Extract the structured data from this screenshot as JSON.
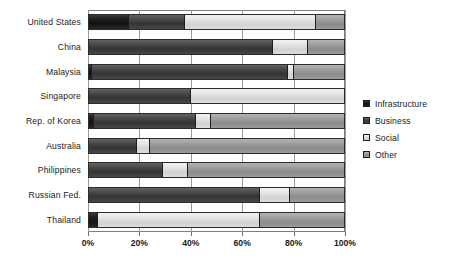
{
  "chart_data": {
    "type": "bar",
    "orientation": "horizontal",
    "stacked": true,
    "normalized": true,
    "title": "",
    "subtitle": "",
    "xlabel": "",
    "ylabel": "",
    "xlim": [
      0,
      100
    ],
    "xticks": [
      0,
      20,
      40,
      60,
      80,
      100
    ],
    "xticklabels": [
      "0%",
      "20%",
      "40%",
      "60%",
      "80%",
      "100%"
    ],
    "grid": true,
    "grid_axis": "x",
    "legend_position": "right",
    "categories": [
      "United States",
      "China",
      "Malaysia",
      "Singapore",
      "Rep. of Korea",
      "Australia",
      "Philippines",
      "Russian Fed.",
      "Thailand"
    ],
    "series": [
      {
        "name": "Infrastructure",
        "color": "#1c1c1c",
        "values": [
          15.5,
          0,
          1.2,
          0,
          2.0,
          0,
          0,
          0,
          3.5
        ]
      },
      {
        "name": "Business",
        "color": "#414141",
        "values": [
          22.2,
          72.0,
          76.8,
          40.0,
          40.0,
          19.0,
          29.0,
          67.0,
          0
        ]
      },
      {
        "name": "Social",
        "color": "#dedede",
        "values": [
          51.3,
          14.0,
          2.5,
          60.0,
          6.0,
          5.0,
          10.0,
          12.0,
          63.5
        ]
      },
      {
        "name": "Other",
        "color": "#9a9a9a",
        "values": [
          11.0,
          14.0,
          19.5,
          0,
          52.0,
          76.0,
          61.0,
          21.0,
          33.0
        ]
      }
    ]
  }
}
